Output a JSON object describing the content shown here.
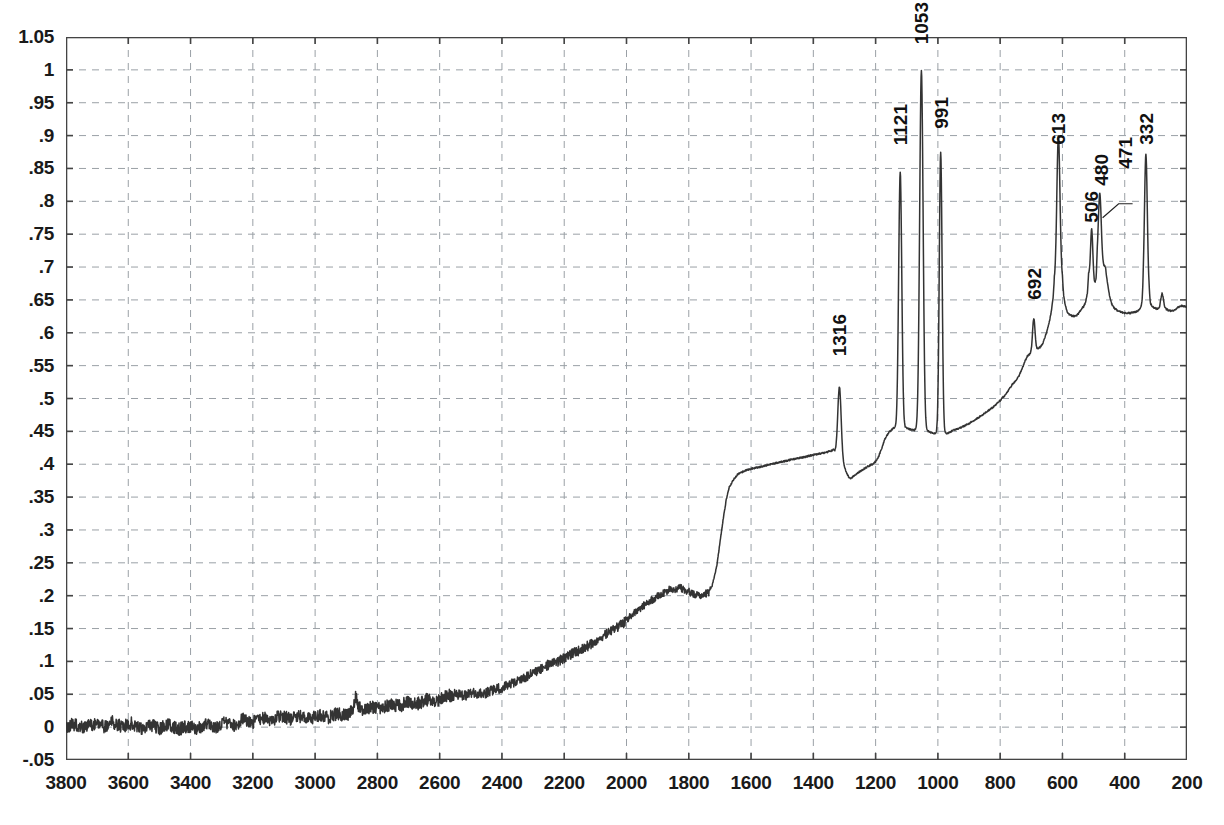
{
  "chart_data": {
    "type": "line",
    "title": "",
    "subtitle": "",
    "xlabel": "",
    "ylabel": "",
    "xlim": [
      3800,
      200
    ],
    "ylim": [
      -0.05,
      1.05
    ],
    "x_reversed": true,
    "grid": true,
    "legend": null,
    "line_color": "#333333",
    "grid_color": "#9aa0a6",
    "axis_color": "#444444",
    "background": "#ffffff",
    "xticks": [
      3800,
      3600,
      3400,
      3200,
      3000,
      2800,
      2600,
      2400,
      2200,
      2000,
      1800,
      1600,
      1400,
      1200,
      1000,
      800,
      600,
      400,
      200
    ],
    "xtick_labels": [
      "3800",
      "3600",
      "3400",
      "3200",
      "3000",
      "2800",
      "2600",
      "2400",
      "2200",
      "2000",
      "1800",
      "1600",
      "1400",
      "1200",
      "1000",
      "800",
      "600",
      "400",
      "200"
    ],
    "yticks": [
      1.05,
      1,
      0.95,
      0.9,
      0.85,
      0.8,
      0.75,
      0.7,
      0.65,
      0.6,
      0.55,
      0.5,
      0.45,
      0.4,
      0.35,
      0.3,
      0.25,
      0.2,
      0.15,
      0.1,
      0.05,
      0,
      -0.05
    ],
    "ytick_labels": [
      "1.05",
      "1",
      ".95",
      ".9",
      ".85",
      ".8",
      ".75",
      ".7",
      ".65",
      ".6",
      ".55",
      ".5",
      ".45",
      ".4",
      ".35",
      ".3",
      ".25",
      ".2",
      ".15",
      ".1",
      ".05",
      "0",
      "-.05"
    ],
    "annotations": [
      {
        "label": "1316",
        "x": 1316,
        "y": 0.525,
        "leader": false
      },
      {
        "label": "1121",
        "x": 1121,
        "y": 0.845,
        "leader": false
      },
      {
        "label": "1053",
        "x": 1053,
        "y": 1.0,
        "leader": false
      },
      {
        "label": "991",
        "x": 991,
        "y": 0.875,
        "leader": false
      },
      {
        "label": "692",
        "x": 692,
        "y": 0.615,
        "leader": false
      },
      {
        "label": "613",
        "x": 613,
        "y": 0.85,
        "leader": false
      },
      {
        "label": "506",
        "x": 506,
        "y": 0.735,
        "leader": false
      },
      {
        "label": "480",
        "x": 480,
        "y": 0.785,
        "leader": false
      },
      {
        "label": "471",
        "x": 471,
        "y": 0.775,
        "leader": true
      },
      {
        "label": "332",
        "x": 332,
        "y": 0.85,
        "leader": false
      }
    ],
    "baseline_points": [
      [
        3800,
        0.002
      ],
      [
        3770,
        0.004
      ],
      [
        3740,
        -0.001
      ],
      [
        3710,
        0.006
      ],
      [
        3680,
        0.001
      ],
      [
        3650,
        0.008
      ],
      [
        3620,
        0.0
      ],
      [
        3590,
        0.006
      ],
      [
        3560,
        -0.003
      ],
      [
        3530,
        0.004
      ],
      [
        3500,
        -0.002
      ],
      [
        3470,
        0.003
      ],
      [
        3440,
        -0.004
      ],
      [
        3410,
        0.002
      ],
      [
        3380,
        -0.002
      ],
      [
        3350,
        0.005
      ],
      [
        3320,
        0.0
      ],
      [
        3290,
        0.007
      ],
      [
        3260,
        0.003
      ],
      [
        3230,
        0.012
      ],
      [
        3200,
        0.007
      ],
      [
        3170,
        0.015
      ],
      [
        3140,
        0.01
      ],
      [
        3110,
        0.018
      ],
      [
        3080,
        0.012
      ],
      [
        3050,
        0.016
      ],
      [
        3020,
        0.012
      ],
      [
        2990,
        0.018
      ],
      [
        2960,
        0.014
      ],
      [
        2930,
        0.02
      ],
      [
        2900,
        0.018
      ],
      [
        2880,
        0.026
      ],
      [
        2870,
        0.048
      ],
      [
        2860,
        0.03
      ],
      [
        2850,
        0.026
      ],
      [
        2820,
        0.03
      ],
      [
        2790,
        0.028
      ],
      [
        2760,
        0.034
      ],
      [
        2730,
        0.032
      ],
      [
        2700,
        0.038
      ],
      [
        2670,
        0.036
      ],
      [
        2640,
        0.042
      ],
      [
        2610,
        0.04
      ],
      [
        2580,
        0.047
      ],
      [
        2550,
        0.05
      ],
      [
        2520,
        0.048
      ],
      [
        2490,
        0.052
      ],
      [
        2460,
        0.05
      ],
      [
        2430,
        0.056
      ],
      [
        2400,
        0.06
      ],
      [
        2370,
        0.066
      ],
      [
        2340,
        0.072
      ],
      [
        2310,
        0.08
      ],
      [
        2280,
        0.088
      ],
      [
        2250,
        0.095
      ],
      [
        2220,
        0.1
      ],
      [
        2190,
        0.108
      ],
      [
        2160,
        0.115
      ],
      [
        2130,
        0.122
      ],
      [
        2100,
        0.13
      ],
      [
        2070,
        0.14
      ],
      [
        2040,
        0.15
      ],
      [
        2010,
        0.158
      ],
      [
        1990,
        0.168
      ],
      [
        1970,
        0.175
      ],
      [
        1950,
        0.183
      ],
      [
        1930,
        0.19
      ],
      [
        1910,
        0.196
      ],
      [
        1890,
        0.202
      ],
      [
        1870,
        0.206
      ],
      [
        1860,
        0.212
      ],
      [
        1845,
        0.208
      ],
      [
        1830,
        0.213
      ],
      [
        1815,
        0.209
      ],
      [
        1800,
        0.206
      ],
      [
        1780,
        0.202
      ],
      [
        1760,
        0.2
      ],
      [
        1745,
        0.203
      ],
      [
        1735,
        0.205
      ],
      [
        1725,
        0.215
      ],
      [
        1710,
        0.245
      ],
      [
        1700,
        0.28
      ],
      [
        1690,
        0.315
      ],
      [
        1680,
        0.345
      ],
      [
        1670,
        0.365
      ],
      [
        1655,
        0.378
      ],
      [
        1640,
        0.386
      ],
      [
        1620,
        0.39
      ],
      [
        1600,
        0.393
      ],
      [
        1580,
        0.395
      ],
      [
        1560,
        0.397
      ],
      [
        1540,
        0.4
      ],
      [
        1520,
        0.402
      ],
      [
        1500,
        0.404
      ],
      [
        1480,
        0.406
      ],
      [
        1460,
        0.408
      ],
      [
        1440,
        0.41
      ],
      [
        1420,
        0.412
      ],
      [
        1400,
        0.414
      ],
      [
        1380,
        0.416
      ],
      [
        1360,
        0.418
      ],
      [
        1345,
        0.42
      ],
      [
        1335,
        0.422
      ],
      [
        1300,
        0.395
      ],
      [
        1290,
        0.383
      ],
      [
        1280,
        0.378
      ],
      [
        1270,
        0.382
      ],
      [
        1260,
        0.386
      ],
      [
        1250,
        0.389
      ],
      [
        1240,
        0.392
      ],
      [
        1230,
        0.395
      ],
      [
        1220,
        0.398
      ],
      [
        1210,
        0.4
      ],
      [
        1200,
        0.404
      ],
      [
        1190,
        0.412
      ],
      [
        1180,
        0.425
      ],
      [
        1170,
        0.438
      ],
      [
        1160,
        0.447
      ],
      [
        1150,
        0.452
      ],
      [
        1142,
        0.455
      ],
      [
        1100,
        0.455
      ],
      [
        1090,
        0.453
      ],
      [
        1080,
        0.452
      ],
      [
        1075,
        0.452
      ],
      [
        1030,
        0.45
      ],
      [
        1020,
        0.448
      ],
      [
        1012,
        0.447
      ],
      [
        970,
        0.447
      ],
      [
        960,
        0.449
      ],
      [
        950,
        0.452
      ],
      [
        940,
        0.453
      ],
      [
        930,
        0.455
      ],
      [
        920,
        0.457
      ],
      [
        900,
        0.462
      ],
      [
        880,
        0.468
      ],
      [
        860,
        0.474
      ],
      [
        840,
        0.481
      ],
      [
        820,
        0.488
      ],
      [
        800,
        0.497
      ],
      [
        785,
        0.505
      ],
      [
        770,
        0.515
      ],
      [
        760,
        0.522
      ],
      [
        750,
        0.527
      ],
      [
        740,
        0.534
      ],
      [
        730,
        0.545
      ],
      [
        720,
        0.557
      ],
      [
        712,
        0.565
      ],
      [
        672,
        0.578
      ],
      [
        665,
        0.582
      ],
      [
        658,
        0.59
      ],
      [
        650,
        0.602
      ],
      [
        642,
        0.617
      ],
      [
        636,
        0.632
      ],
      [
        630,
        0.652
      ],
      [
        626,
        0.678
      ],
      [
        600,
        0.68
      ],
      [
        596,
        0.655
      ],
      [
        590,
        0.64
      ],
      [
        585,
        0.632
      ],
      [
        578,
        0.628
      ],
      [
        570,
        0.626
      ],
      [
        560,
        0.625
      ],
      [
        550,
        0.628
      ],
      [
        544,
        0.633
      ],
      [
        538,
        0.637
      ],
      [
        532,
        0.64
      ],
      [
        526,
        0.646
      ],
      [
        520,
        0.66
      ],
      [
        516,
        0.69
      ],
      [
        496,
        0.675
      ],
      [
        492,
        0.68
      ],
      [
        488,
        0.71
      ],
      [
        462,
        0.7
      ],
      [
        458,
        0.685
      ],
      [
        452,
        0.665
      ],
      [
        446,
        0.65
      ],
      [
        440,
        0.642
      ],
      [
        432,
        0.637
      ],
      [
        424,
        0.634
      ],
      [
        415,
        0.632
      ],
      [
        400,
        0.63
      ],
      [
        385,
        0.63
      ],
      [
        370,
        0.631
      ],
      [
        358,
        0.633
      ],
      [
        350,
        0.637
      ],
      [
        344,
        0.645
      ],
      [
        340,
        0.662
      ],
      [
        322,
        0.66
      ],
      [
        318,
        0.645
      ],
      [
        312,
        0.64
      ],
      [
        306,
        0.638
      ],
      [
        300,
        0.637
      ],
      [
        292,
        0.636
      ],
      [
        288,
        0.64
      ],
      [
        284,
        0.652
      ],
      [
        280,
        0.661
      ],
      [
        276,
        0.652
      ],
      [
        272,
        0.64
      ],
      [
        266,
        0.636
      ],
      [
        258,
        0.634
      ],
      [
        248,
        0.633
      ],
      [
        238,
        0.635
      ],
      [
        228,
        0.639
      ],
      [
        218,
        0.641
      ],
      [
        208,
        0.64
      ],
      [
        200,
        0.639
      ]
    ],
    "peaks": [
      {
        "center": 1316,
        "height": 0.51,
        "width": 11,
        "base": 0.4
      },
      {
        "center": 1121,
        "height": 0.845,
        "width": 10,
        "base": 0.455
      },
      {
        "center": 1053,
        "height": 1.0,
        "width": 11,
        "base": 0.452
      },
      {
        "center": 991,
        "height": 0.875,
        "width": 9,
        "base": 0.447
      },
      {
        "center": 692,
        "height": 0.615,
        "width": 8,
        "base": 0.565
      },
      {
        "center": 613,
        "height": 0.85,
        "width": 10,
        "base": 0.63
      },
      {
        "center": 506,
        "height": 0.735,
        "width": 7,
        "base": 0.66
      },
      {
        "center": 480,
        "height": 0.785,
        "width": 9,
        "base": 0.68
      },
      {
        "center": 332,
        "height": 0.85,
        "width": 9,
        "base": 0.64
      }
    ]
  }
}
